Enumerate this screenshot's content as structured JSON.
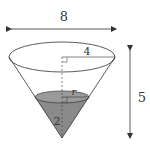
{
  "diagram": {
    "type": "cone-with-liquid",
    "labels": {
      "top_width": "8",
      "top_radius": "4",
      "height": "5",
      "liquid_radius": "r",
      "liquid_height": "2"
    },
    "colors": {
      "line": "#333333",
      "liquid_fill": "#8a8a8a",
      "liquid_top": "#9a9a9a",
      "background": "#ffffff"
    }
  }
}
